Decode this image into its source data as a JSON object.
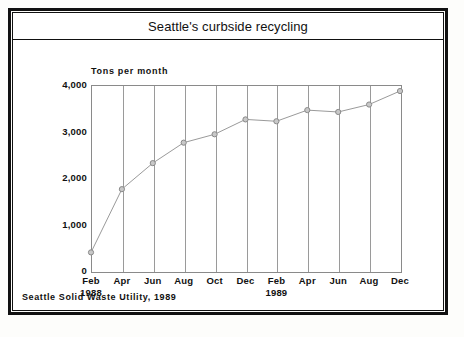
{
  "chart_data": {
    "type": "line",
    "title": "Seattle's curbside recycling",
    "ylabel": "Tons per month",
    "xlabel": "",
    "source": "Seattle Solid Waste Utility, 1989",
    "ylim": [
      0,
      4000
    ],
    "yticks": [
      0,
      1000,
      2000,
      3000,
      4000
    ],
    "ytick_labels": [
      "0",
      "1,000",
      "2,000",
      "3,000",
      "4,000"
    ],
    "grid": "vertical",
    "legend": "none",
    "categories": [
      "Feb",
      "Apr",
      "Jun",
      "Aug",
      "Oct",
      "Dec",
      "Feb",
      "Apr",
      "Jun",
      "Aug",
      "Dec"
    ],
    "year_labels": [
      {
        "index": 0,
        "text": "1988"
      },
      {
        "index": 6,
        "text": "1989"
      }
    ],
    "values": [
      400,
      1760,
      2320,
      2760,
      2940,
      3260,
      3220,
      3460,
      3420,
      3580,
      3870
    ],
    "marker": "circle",
    "line_color": "#9a9a9a",
    "marker_color": "#8a8a8a"
  },
  "frame": {
    "border_color": "#111111",
    "background": "#ffffff"
  }
}
